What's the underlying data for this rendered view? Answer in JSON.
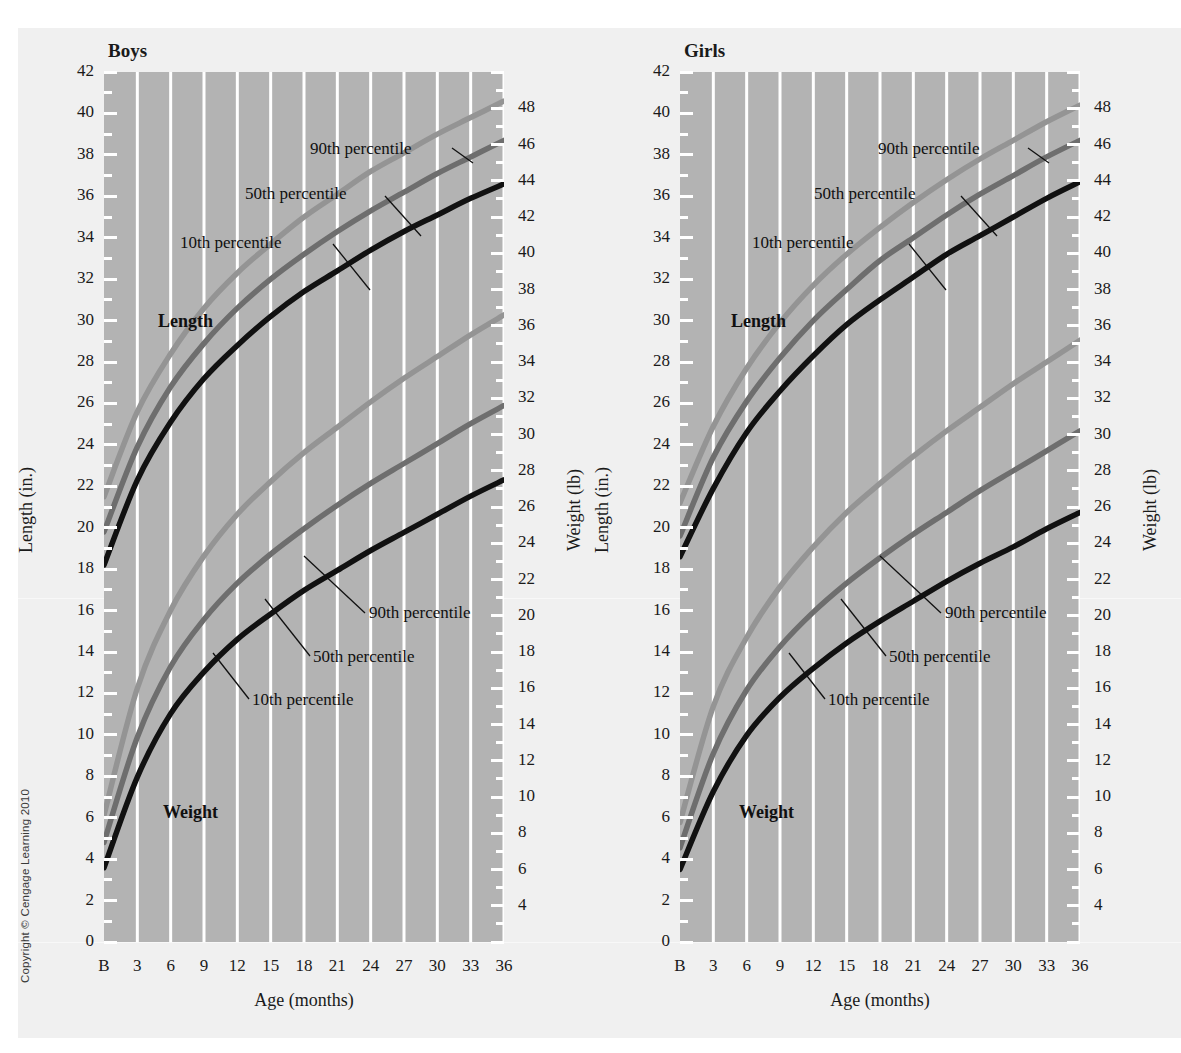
{
  "figure": {
    "copyright": "Copyright © Cengage Learning 2010",
    "background_color": "#f0f0f0",
    "plot_fill": "#b3b3b3",
    "gridline_color": "#ffffff"
  },
  "colors": {
    "p90": "#949494",
    "p50": "#6e6e6e",
    "p10": "#111111",
    "text": "#1a1a1a"
  },
  "axes": {
    "left_title": "Length (in.)",
    "right_title": "Weight (lb)",
    "x_title": "Age (months)",
    "left_ticks": [
      "42",
      "40",
      "38",
      "36",
      "34",
      "32",
      "30",
      "28",
      "26",
      "24",
      "22",
      "20",
      "18",
      "16",
      "14",
      "12",
      "10",
      "8",
      "6",
      "4",
      "2",
      "0"
    ],
    "right_ticks": [
      "48",
      "46",
      "44",
      "42",
      "40",
      "38",
      "36",
      "34",
      "32",
      "30",
      "28",
      "26",
      "24",
      "22",
      "20",
      "18",
      "16",
      "14",
      "12",
      "10",
      "8",
      "6",
      "4"
    ],
    "x_ticks": [
      "B",
      "3",
      "6",
      "9",
      "12",
      "15",
      "18",
      "21",
      "24",
      "27",
      "30",
      "33",
      "36"
    ],
    "left_range": [
      0,
      42
    ],
    "right_range": [
      2,
      50
    ],
    "x_range": [
      0,
      36
    ]
  },
  "labels": {
    "length": "Length",
    "weight": "Weight",
    "p90": "90th percentile",
    "p50": "50th percentile",
    "p10": "10th percentile"
  },
  "chart_data": [
    {
      "type": "line",
      "title": "Boys",
      "xlabel": "Age (months)",
      "ylabel": "Length (in.)",
      "ylabel_right": "Weight (lb)",
      "x": [
        0,
        3,
        6,
        9,
        12,
        15,
        18,
        21,
        24,
        27,
        30,
        33,
        36
      ],
      "ylim": [
        0,
        42
      ],
      "ylim_right": [
        2,
        50
      ],
      "grid": true,
      "legend": "inline-annotations",
      "series": [
        {
          "name": "Length 90th percentile",
          "measure": "length",
          "percentile": 90,
          "unit": "in.",
          "color": "#949494",
          "values": [
            21.5,
            25.6,
            28.4,
            30.6,
            32.3,
            33.7,
            35.0,
            36.1,
            37.2,
            38.1,
            39.0,
            39.8,
            40.6
          ]
        },
        {
          "name": "Length 50th percentile",
          "measure": "length",
          "percentile": 50,
          "unit": "in.",
          "color": "#6e6e6e",
          "values": [
            19.8,
            23.9,
            26.8,
            28.9,
            30.6,
            32.0,
            33.2,
            34.3,
            35.3,
            36.2,
            37.1,
            37.9,
            38.7
          ]
        },
        {
          "name": "Length 10th percentile",
          "measure": "length",
          "percentile": 10,
          "unit": "in.",
          "color": "#111111",
          "values": [
            18.2,
            22.3,
            25.1,
            27.2,
            28.8,
            30.2,
            31.4,
            32.4,
            33.4,
            34.3,
            35.1,
            35.9,
            36.6
          ]
        },
        {
          "name": "Weight 90th percentile",
          "measure": "weight",
          "percentile": 90,
          "unit": "lb",
          "color": "#949494",
          "values": [
            9.0,
            16.0,
            20.3,
            23.3,
            25.6,
            27.4,
            29.0,
            30.4,
            31.8,
            33.1,
            34.3,
            35.5,
            36.6
          ]
        },
        {
          "name": "Weight 50th percentile",
          "measure": "weight",
          "percentile": 50,
          "unit": "lb",
          "color": "#6e6e6e",
          "values": [
            7.5,
            13.3,
            17.2,
            19.8,
            21.8,
            23.4,
            24.8,
            26.1,
            27.3,
            28.4,
            29.5,
            30.6,
            31.6
          ]
        },
        {
          "name": "Weight 10th percentile",
          "measure": "weight",
          "percentile": 10,
          "unit": "lb",
          "color": "#111111",
          "values": [
            6.1,
            11.1,
            14.6,
            16.9,
            18.7,
            20.1,
            21.4,
            22.5,
            23.6,
            24.6,
            25.6,
            26.6,
            27.5
          ]
        }
      ]
    },
    {
      "type": "line",
      "title": "Girls",
      "xlabel": "Age (months)",
      "ylabel": "Length (in.)",
      "ylabel_right": "Weight (lb)",
      "x": [
        0,
        3,
        6,
        9,
        12,
        15,
        18,
        21,
        24,
        27,
        30,
        33,
        36
      ],
      "ylim": [
        0,
        42
      ],
      "ylim_right": [
        2,
        50
      ],
      "grid": true,
      "legend": "inline-annotations",
      "series": [
        {
          "name": "Length 90th percentile",
          "measure": "length",
          "percentile": 90,
          "unit": "in.",
          "color": "#949494",
          "values": [
            21.2,
            24.9,
            27.7,
            29.9,
            31.7,
            33.2,
            34.5,
            35.7,
            36.8,
            37.8,
            38.7,
            39.6,
            40.4
          ]
        },
        {
          "name": "Length 50th percentile",
          "measure": "length",
          "percentile": 50,
          "unit": "in.",
          "color": "#6e6e6e",
          "values": [
            19.6,
            23.4,
            26.1,
            28.2,
            30.0,
            31.5,
            32.9,
            34.0,
            35.1,
            36.1,
            37.0,
            37.9,
            38.7
          ]
        },
        {
          "name": "Length 10th percentile",
          "measure": "length",
          "percentile": 10,
          "unit": "in.",
          "color": "#111111",
          "values": [
            18.6,
            21.9,
            24.6,
            26.6,
            28.3,
            29.8,
            31.0,
            32.1,
            33.2,
            34.1,
            35.0,
            35.9,
            36.7
          ]
        },
        {
          "name": "Weight 90th percentile",
          "measure": "weight",
          "percentile": 90,
          "unit": "lb",
          "color": "#949494",
          "values": [
            8.6,
            15.0,
            18.8,
            21.6,
            23.8,
            25.7,
            27.3,
            28.8,
            30.2,
            31.5,
            32.8,
            34.0,
            35.2
          ]
        },
        {
          "name": "Weight 50th percentile",
          "measure": "weight",
          "percentile": 50,
          "unit": "lb",
          "color": "#6e6e6e",
          "values": [
            7.2,
            12.4,
            15.9,
            18.3,
            20.2,
            21.8,
            23.2,
            24.5,
            25.7,
            26.9,
            28.0,
            29.1,
            30.2
          ]
        },
        {
          "name": "Weight 10th percentile",
          "measure": "weight",
          "percentile": 10,
          "unit": "lb",
          "color": "#111111",
          "values": [
            6.0,
            10.3,
            13.4,
            15.5,
            17.1,
            18.5,
            19.7,
            20.8,
            21.9,
            22.9,
            23.8,
            24.8,
            25.7
          ]
        }
      ]
    }
  ]
}
